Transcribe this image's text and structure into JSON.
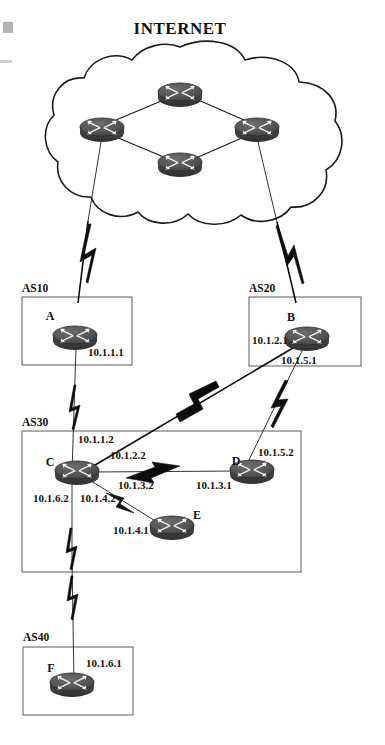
{
  "diagram": {
    "title": "INTERNET",
    "type": "network-topology",
    "background_color": "#ffffff",
    "router_color": "#4a4a4a",
    "line_color": "#1c1c1c",
    "box_border_color": "#5b5b5b"
  },
  "cloud": {
    "label": "INTERNET",
    "routers": [
      {
        "id": "cloud-top",
        "cx": 180,
        "cy": 93
      },
      {
        "id": "cloud-left",
        "cx": 102,
        "cy": 128
      },
      {
        "id": "cloud-right",
        "cx": 257,
        "cy": 128
      },
      {
        "id": "cloud-bottom",
        "cx": 180,
        "cy": 163
      }
    ],
    "internal_links": [
      {
        "from": "cloud-left",
        "to": "cloud-top"
      },
      {
        "from": "cloud-top",
        "to": "cloud-right"
      },
      {
        "from": "cloud-left",
        "to": "cloud-bottom"
      },
      {
        "from": "cloud-bottom",
        "to": "cloud-right"
      }
    ]
  },
  "autonomous_systems": [
    {
      "id": "as10",
      "label": "AS10",
      "x": 22,
      "y": 297,
      "width": 110,
      "height": 68
    },
    {
      "id": "as20",
      "label": "AS20",
      "x": 249,
      "y": 297,
      "width": 112,
      "height": 69
    },
    {
      "id": "as30",
      "label": "AS30",
      "x": 22,
      "y": 431,
      "width": 279,
      "height": 141
    },
    {
      "id": "as40",
      "label": "AS40",
      "x": 23,
      "y": 647,
      "width": 110,
      "height": 68
    }
  ],
  "routers": [
    {
      "id": "A",
      "label": "A",
      "as": "AS10",
      "cx": 75,
      "cy": 337
    },
    {
      "id": "B",
      "label": "B",
      "as": "AS20",
      "cx": 307,
      "cy": 338
    },
    {
      "id": "C",
      "label": "C",
      "as": "AS30",
      "cx": 77,
      "cy": 472
    },
    {
      "id": "D",
      "label": "D",
      "as": "AS30",
      "cx": 252,
      "cy": 471
    },
    {
      "id": "E",
      "label": "E",
      "as": "AS30",
      "cx": 172,
      "cy": 527
    },
    {
      "id": "F",
      "label": "F",
      "as": "AS40",
      "cx": 72,
      "cy": 684
    }
  ],
  "interface_addresses": [
    {
      "id": "ip-a",
      "router": "A",
      "address": "10.1.1.1",
      "x": 88,
      "y": 356
    },
    {
      "id": "ip-b-2",
      "router": "B",
      "address": "10.1.2.1",
      "x": 252,
      "y": 344
    },
    {
      "id": "ip-b-5",
      "router": "B",
      "address": "10.1.5.1",
      "x": 281,
      "y": 364
    },
    {
      "id": "ip-c-1",
      "router": "C",
      "address": "10.1.1.2",
      "x": 78,
      "y": 443
    },
    {
      "id": "ip-c-2",
      "router": "C",
      "address": "10.1.2.2",
      "x": 110,
      "y": 459
    },
    {
      "id": "ip-c-3",
      "router": "C",
      "address": "10.1.3.2",
      "x": 118,
      "y": 489
    },
    {
      "id": "ip-c-6",
      "router": "C",
      "address": "10.1.6.2",
      "x": 33,
      "y": 502
    },
    {
      "id": "ip-c-4",
      "router": "C",
      "address": "10.1.4.2",
      "x": 80,
      "y": 502
    },
    {
      "id": "ip-d-3",
      "router": "D",
      "address": "10.1.3.1",
      "x": 196,
      "y": 489
    },
    {
      "id": "ip-d-5",
      "router": "D",
      "address": "10.1.5.2",
      "x": 258,
      "y": 456
    },
    {
      "id": "ip-e-4",
      "router": "E",
      "address": "10.1.4.1",
      "x": 113,
      "y": 534
    },
    {
      "id": "ip-f-6",
      "router": "F",
      "address": "10.1.6.1",
      "x": 86,
      "y": 667
    }
  ],
  "links": [
    {
      "id": "link-a-internet",
      "from": "A",
      "to": "cloud-left",
      "network": "internet-uplink",
      "kind": "serial"
    },
    {
      "id": "link-b-internet",
      "from": "B",
      "to": "cloud-right",
      "network": "internet-uplink",
      "kind": "serial"
    },
    {
      "id": "link-a-c",
      "from": "A",
      "to": "C",
      "network": "10.1.1.0",
      "kind": "serial"
    },
    {
      "id": "link-b-c",
      "from": "B",
      "to": "C",
      "network": "10.1.2.0",
      "kind": "serial"
    },
    {
      "id": "link-b-d",
      "from": "B",
      "to": "D",
      "network": "10.1.5.0",
      "kind": "serial"
    },
    {
      "id": "link-c-d",
      "from": "C",
      "to": "D",
      "network": "10.1.3.0",
      "kind": "serial"
    },
    {
      "id": "link-c-e",
      "from": "C",
      "to": "E",
      "network": "10.1.4.0",
      "kind": "serial"
    },
    {
      "id": "link-c-f",
      "from": "C",
      "to": "F",
      "network": "10.1.6.0",
      "kind": "serial"
    }
  ]
}
